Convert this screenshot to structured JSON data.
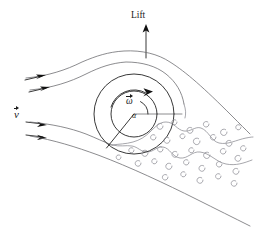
{
  "figure": {
    "background_color": "#ffffff",
    "width": 254,
    "height": 235
  },
  "labels": {
    "lift": "Lift",
    "velocity": "v",
    "angular_velocity": "ω",
    "angle": "α"
  },
  "colors": {
    "line_dark": "#222222",
    "line_mid": "#6e6e72",
    "line_light": "#8a8a90",
    "eddy": "#9a9aa0",
    "text": "#1a1a1a",
    "background": "#ffffff"
  },
  "elements": {
    "lift_arrow": {
      "name": "lift-arrow",
      "direction": "up",
      "x": 146,
      "y_start": 58,
      "y_end": 26
    },
    "outer_circle": {
      "name": "cylinder-outer-circle",
      "cx": 134,
      "cy": 114,
      "r": 40
    },
    "inner_circle": {
      "name": "cylinder-inner-circle",
      "cx": 134,
      "cy": 114,
      "r": 23
    },
    "radius_line": {
      "name": "radius-horizontal",
      "x1": 134,
      "y1": 114,
      "x2": 181,
      "y2": 114
    },
    "stagnation_line": {
      "name": "stagnation-radius-line",
      "x1": 134,
      "y1": 114,
      "x2": 107,
      "y2": 148
    },
    "circulation_arc": {
      "name": "circulation-arc-arrow",
      "rotation": "clockwise"
    },
    "inflow_arrows": [
      {
        "name": "inflow-arrow-1",
        "y": 78
      },
      {
        "name": "inflow-arrow-2",
        "y": 90
      },
      {
        "name": "inflow-arrow-3",
        "y": 122
      },
      {
        "name": "inflow-arrow-4",
        "y": 135
      }
    ],
    "streamline_count": 4,
    "eddy_count": 34,
    "wake_region": "turbulent-wake-lower-right"
  }
}
